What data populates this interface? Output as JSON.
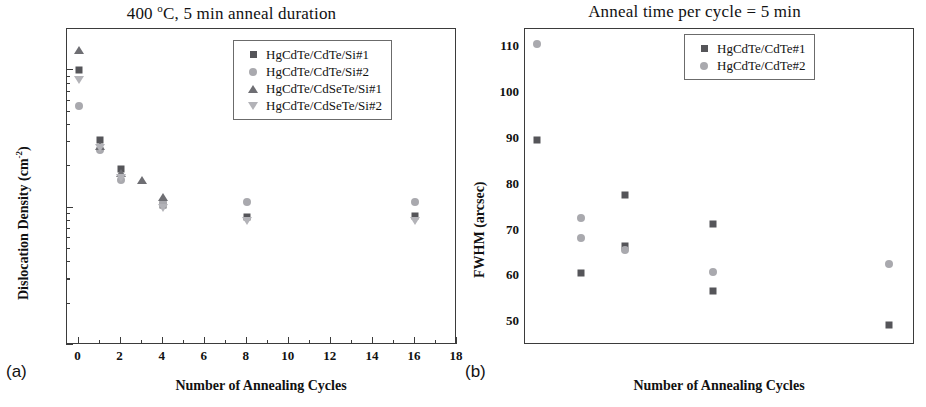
{
  "figure": {
    "panels": [
      {
        "id": "a",
        "panel_label": "(a)",
        "title_main": "400 ",
        "title_sup": "o",
        "title_rest": "C, 5 min anneal duration",
        "title_full": "400 oC, 5 min anneal duration",
        "xlabel": "Number of Annealing Cycles",
        "ylabel_main": "Dislocation Density (cm",
        "ylabel_sup": "-2",
        "ylabel_close": ")",
        "ylabel_full": "Dislocation Density (cm-2)",
        "xticks": [
          "0",
          "2",
          "4",
          "6",
          "8",
          "10",
          "12",
          "14",
          "16",
          "18"
        ],
        "yticks": [
          "10",
          "10",
          "10"
        ],
        "yexps": [
          "5",
          "6",
          "7"
        ],
        "legend": [
          {
            "marker": "square",
            "label": "HgCdTe/CdTe/Si#1"
          },
          {
            "marker": "circle",
            "label": "HgCdTe/CdTe/Si#2"
          },
          {
            "marker": "triangle-up",
            "label": "HgCdTe/CdSeTe/Si#1"
          },
          {
            "marker": "triangle-down",
            "label": "HgCdTe/CdSeTe/Si#2"
          }
        ]
      },
      {
        "id": "b",
        "panel_label": "(b)",
        "title_full": "Anneal time per cycle = 5 min",
        "xlabel": "Number of Annealing Cycles",
        "ylabel_full": "FWHM (arcsec)",
        "xticks": [
          "0",
          "2",
          "4",
          "6",
          "8",
          "10",
          "12",
          "14",
          "16"
        ],
        "yticks": [
          "50",
          "60",
          "70",
          "80",
          "90",
          "100",
          "110"
        ],
        "legend": [
          {
            "marker": "square",
            "label": "HgCdTe/CdTe#1"
          },
          {
            "marker": "circle",
            "label": "HgCdTe/CdTe#2"
          }
        ]
      }
    ]
  },
  "colors": {
    "square": "#555559",
    "circle": "#a9a9ae",
    "triangle_up": "#6e6e73",
    "triangle_down": "#b3b3b8",
    "axis": "#3b3b3b",
    "background": "#ffffff"
  },
  "chart_data": [
    {
      "type": "scatter",
      "panel": "a",
      "title": "400 oC, 5 min anneal duration",
      "xlabel": "Number of Annealing Cycles",
      "ylabel": "Dislocation Density (cm-2)",
      "xlim": [
        -0.55,
        18
      ],
      "ylim": [
        100000,
        20000000
      ],
      "yscale": "log",
      "xscale": "linear",
      "grid": false,
      "legend_position": "top-right",
      "xticks": [
        0,
        2,
        4,
        6,
        8,
        10,
        12,
        14,
        16,
        18
      ],
      "yticks": [
        100000,
        1000000,
        10000000
      ],
      "ytick_labels": [
        "10^5",
        "10^6",
        "10^7"
      ],
      "series": [
        {
          "name": "HgCdTe/CdTe/Si#1",
          "marker": "square",
          "color": "#555559",
          "points": [
            {
              "x": 0,
              "y": 10000000
            },
            {
              "x": 1,
              "y": 3100000
            },
            {
              "x": 2,
              "y": 1900000
            },
            {
              "x": 4,
              "y": 1050000
            },
            {
              "x": 8,
              "y": 850000
            },
            {
              "x": 16,
              "y": 870000
            }
          ]
        },
        {
          "name": "HgCdTe/CdTe/Si#2",
          "marker": "circle",
          "color": "#a9a9ae",
          "points": [
            {
              "x": 0,
              "y": 5500000
            },
            {
              "x": 1,
              "y": 2650000
            },
            {
              "x": 2,
              "y": 1600000
            },
            {
              "x": 4,
              "y": 1080000
            },
            {
              "x": 8,
              "y": 1100000
            },
            {
              "x": 16,
              "y": 1100000
            }
          ]
        },
        {
          "name": "HgCdTe/CdSeTe/Si#1",
          "marker": "triangle-up",
          "color": "#6e6e73",
          "points": [
            {
              "x": 0,
              "y": 14000000
            },
            {
              "x": 1,
              "y": 2800000
            },
            {
              "x": 2,
              "y": 1800000
            },
            {
              "x": 3,
              "y": 1600000
            },
            {
              "x": 4,
              "y": 1200000
            }
          ]
        },
        {
          "name": "HgCdTe/CdSeTe/Si#2",
          "marker": "triangle-down",
          "color": "#b3b3b8",
          "points": [
            {
              "x": 0,
              "y": 8500000
            },
            {
              "x": 1,
              "y": 2700000
            },
            {
              "x": 2,
              "y": 1650000
            },
            {
              "x": 4,
              "y": 1000000
            },
            {
              "x": 8,
              "y": 800000
            },
            {
              "x": 16,
              "y": 800000
            }
          ]
        }
      ]
    },
    {
      "type": "scatter",
      "panel": "b",
      "title": "Anneal time per cycle = 5 min",
      "xlabel": "Number of Annealing Cycles",
      "ylabel": "FWHM (arcsec)",
      "xlim": [
        -0.55,
        17.2
      ],
      "ylim": [
        45,
        114
      ],
      "yscale": "linear",
      "xscale": "linear",
      "grid": false,
      "legend_position": "top-right",
      "xticks": [
        0,
        2,
        4,
        6,
        8,
        10,
        12,
        14,
        16
      ],
      "yticks": [
        50,
        60,
        70,
        80,
        90,
        100,
        110
      ],
      "series": [
        {
          "name": "HgCdTe/CdTe#1",
          "marker": "square",
          "color": "#555559",
          "points": [
            {
              "x": 0,
              "y": 89.7
            },
            {
              "x": 2,
              "y": 60.7
            },
            {
              "x": 4,
              "y": 77.7
            },
            {
              "x": 4,
              "y": 66.7
            },
            {
              "x": 8,
              "y": 71.4
            },
            {
              "x": 8,
              "y": 56.8
            },
            {
              "x": 16,
              "y": 49.3
            }
          ]
        },
        {
          "name": "HgCdTe/CdTe#2",
          "marker": "circle",
          "color": "#a9a9ae",
          "points": [
            {
              "x": 0,
              "y": 110.7
            },
            {
              "x": 2,
              "y": 72.7
            },
            {
              "x": 2,
              "y": 68.3
            },
            {
              "x": 4,
              "y": 65.7
            },
            {
              "x": 8,
              "y": 61.0
            },
            {
              "x": 16,
              "y": 62.7
            }
          ]
        }
      ]
    }
  ]
}
